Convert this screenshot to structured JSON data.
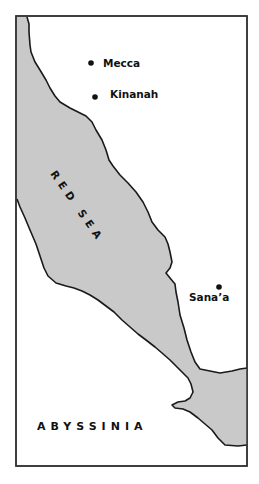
{
  "map": {
    "colors": {
      "background": "#ffffff",
      "sea_fill": "#c9c9c9",
      "coastline": "#1a1a1a",
      "frame": "#333333",
      "text": "#111111"
    },
    "water_bodies": [
      {
        "name": "RED SEA"
      }
    ],
    "regions": [
      {
        "name": "ABYSSINIA"
      }
    ],
    "cities": [
      {
        "name": "Mecca"
      },
      {
        "name": "Kinanah"
      },
      {
        "name": "Sana’a"
      }
    ]
  }
}
